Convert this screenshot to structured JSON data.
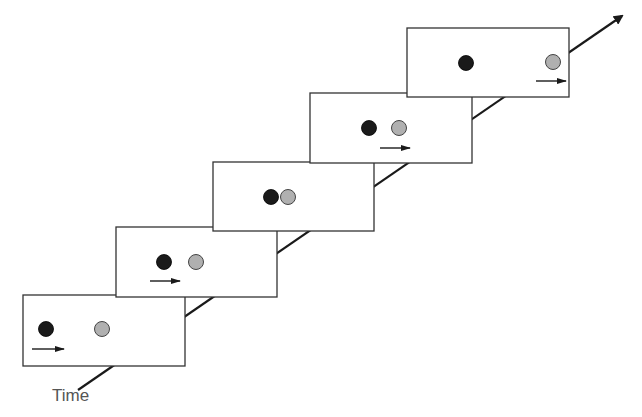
{
  "diagram": {
    "axis_label": "Time",
    "axis": {
      "x1": 78,
      "y1": 390,
      "x2": 622,
      "y2": 16
    },
    "colors": {
      "frame_stroke": "#333333",
      "black_ball": "#1a1a1a",
      "gray_ball": "#b0b0b0",
      "axis": "#1a1a1a"
    },
    "frames": [
      {
        "index": 1,
        "x": 23,
        "y": 295,
        "w": 162,
        "h": 71,
        "black": [
          46,
          329
        ],
        "gray": [
          102,
          329
        ],
        "arrow": [
          32,
          64,
          349
        ]
      },
      {
        "index": 2,
        "x": 116,
        "y": 227,
        "w": 161,
        "h": 70,
        "black": [
          164,
          262
        ],
        "gray": [
          196,
          262
        ],
        "arrow": [
          150,
          180,
          281
        ]
      },
      {
        "index": 3,
        "x": 213,
        "y": 162,
        "w": 161,
        "h": 69,
        "black": [
          271,
          197
        ],
        "gray": [
          288,
          197
        ],
        "arrow": null
      },
      {
        "index": 4,
        "x": 310,
        "y": 93,
        "w": 162,
        "h": 70,
        "black": [
          369,
          128
        ],
        "gray": [
          399,
          128
        ],
        "arrow": [
          380,
          410,
          148
        ]
      },
      {
        "index": 5,
        "x": 407,
        "y": 28,
        "w": 162,
        "h": 69,
        "black": [
          466,
          63
        ],
        "gray": [
          553,
          62
        ],
        "arrow": [
          536,
          566,
          81
        ]
      }
    ]
  }
}
